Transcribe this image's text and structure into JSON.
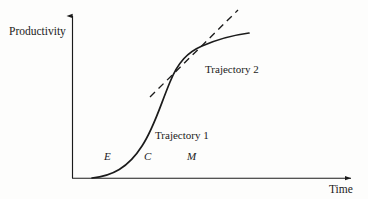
{
  "figure": {
    "background_color": "#fdfdfc",
    "ink_color": "#1b1b1b",
    "axes": {
      "y_label": "Productivity",
      "x_label": "Time",
      "origin": {
        "x": 72,
        "y": 178
      },
      "y_axis_top": {
        "x": 72,
        "y": 12
      },
      "x_axis_right": {
        "x": 356,
        "y": 178
      },
      "arrowheads": [
        "y-axis-top",
        "x-axis-right"
      ]
    },
    "stage_markers": [
      {
        "id": "E",
        "label": "E",
        "x": 104,
        "y": 151,
        "meaning": "emergence-stage"
      },
      {
        "id": "C",
        "label": "C",
        "x": 144,
        "y": 151,
        "meaning": "coalescence-stage"
      },
      {
        "id": "M",
        "label": "M",
        "x": 187,
        "y": 151,
        "meaning": "maturity-stage"
      }
    ],
    "curves": [
      {
        "id": "trajectory-1",
        "label": "Trajectory 1",
        "style": "solid",
        "label_x": 155,
        "label_y": 130,
        "shape": "s-curve",
        "start": {
          "x": 92,
          "y": 178
        },
        "end": {
          "x": 249,
          "y": 33
        },
        "path": "M 92 178 C 112 176 128 168 142 146 C 154 128 160 106 170 82 C 178 62 188 52 202 46 C 218 39 234 35 249 33"
      },
      {
        "id": "trajectory-2",
        "label": "Trajectory 2",
        "style": "dashed",
        "label_x": 205,
        "label_y": 64,
        "shape": "straight-line",
        "start": {
          "x": 150,
          "y": 97
        },
        "end": {
          "x": 238,
          "y": 10
        },
        "dash_pattern": "7 5"
      }
    ],
    "intersections": [
      {
        "between": [
          "trajectory-1",
          "trajectory-2"
        ],
        "x": 167,
        "y": 82
      },
      {
        "between": [
          "trajectory-1",
          "trajectory-2"
        ],
        "x": 212,
        "y": 44
      }
    ]
  }
}
